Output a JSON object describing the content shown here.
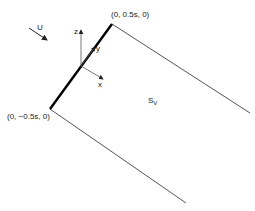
{
  "diagram": {
    "labels": {
      "top_point": "(0, 0.5s, 0)",
      "bottom_point": "(0, −0.5s, 0)",
      "flow": "U",
      "surface_main": "S",
      "surface_sub": "V",
      "axis_x": "x",
      "axis_y": "y",
      "axis_z": "z"
    },
    "colors": {
      "edge": "#000000",
      "wake": "#555555",
      "axis": "#444444"
    },
    "icons": {
      "flow_arrow": "arrow-icon"
    }
  }
}
